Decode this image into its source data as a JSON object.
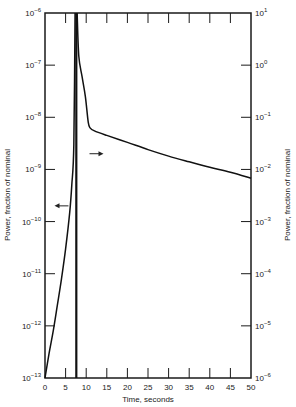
{
  "chart_data": {
    "type": "line",
    "title": "",
    "xlabel": "Time, seconds",
    "ylabel_left": "Power, fraction of nominal",
    "ylabel_right": "Power, fraction of nominal",
    "xlim": [
      0,
      50
    ],
    "ylim_left": [
      1e-13,
      1e-06
    ],
    "ylim_right": [
      1e-06,
      10
    ],
    "yscale": "log",
    "grid": false,
    "x_ticks": [
      0,
      5,
      10,
      15,
      20,
      25,
      30,
      35,
      40,
      45,
      50
    ],
    "x_tick_labels": [
      "0",
      "5",
      "10",
      "15",
      "20",
      "25",
      "30",
      "35",
      "40",
      "45",
      "50"
    ],
    "y_left_ticks": [
      {
        "base": "10",
        "exp": "−6",
        "value": 1e-06
      },
      {
        "base": "10",
        "exp": "−7",
        "value": 1e-07
      },
      {
        "base": "10",
        "exp": "−8",
        "value": 1e-08
      },
      {
        "base": "10",
        "exp": "−9",
        "value": 1e-09
      },
      {
        "base": "10",
        "exp": "−10",
        "value": 1e-10
      },
      {
        "base": "10",
        "exp": "−11",
        "value": 1e-11
      },
      {
        "base": "10",
        "exp": "−12",
        "value": 1e-12
      },
      {
        "base": "10",
        "exp": "−13",
        "value": 1e-13
      }
    ],
    "y_right_ticks": [
      {
        "base": "10",
        "exp": "1",
        "value": 10
      },
      {
        "base": "10",
        "exp": "0",
        "value": 1
      },
      {
        "base": "10",
        "exp": "−1",
        "value": 0.1
      },
      {
        "base": "10",
        "exp": "−2",
        "value": 0.01
      },
      {
        "base": "10",
        "exp": "−3",
        "value": 0.001
      },
      {
        "base": "10",
        "exp": "−4",
        "value": 0.0001
      },
      {
        "base": "10",
        "exp": "−5",
        "value": 1e-05
      },
      {
        "base": "10",
        "exp": "−6",
        "value": 1e-06
      }
    ],
    "series": [
      {
        "name": "Power rise (left axis)",
        "axis": "left",
        "x": [
          0,
          1,
          2,
          3,
          4,
          5,
          6,
          6.5,
          7,
          7.3
        ],
        "y": [
          1e-13,
          3e-13,
          8e-13,
          2.5e-12,
          8e-12,
          3e-11,
          1.5e-10,
          5e-10,
          3e-09,
          1e-06
        ]
      },
      {
        "name": "Power decay (right axis)",
        "axis": "right",
        "x": [
          7.8,
          8.2,
          9,
          9.8,
          10.5,
          11,
          12,
          15,
          20,
          25,
          30,
          35,
          40,
          45,
          50
        ],
        "y": [
          10,
          1.5,
          0.6,
          0.25,
          0.08,
          0.062,
          0.055,
          0.045,
          0.033,
          0.024,
          0.018,
          0.014,
          0.011,
          0.0088,
          0.0068
        ]
      },
      {
        "name": "Transition marker",
        "axis": "both",
        "x": [
          7.6,
          7.6
        ],
        "y_note": "vertical line spanning full height at t ≈ 7.6 s"
      }
    ],
    "annotations": [
      {
        "type": "arrow",
        "direction": "left",
        "meaning": "left curve reads on left axis",
        "x": 4,
        "y_left": 2e-10
      },
      {
        "type": "arrow",
        "direction": "right",
        "meaning": "right curve reads on right axis",
        "x": 12.5,
        "y_right": 0.02
      }
    ],
    "legend": "none"
  }
}
